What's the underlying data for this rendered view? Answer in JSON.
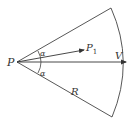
{
  "diagram": {
    "type": "sector-geometry",
    "stroke_color": "#333333",
    "background": "#ffffff",
    "labels": {
      "origin": "P",
      "p1": "P",
      "p1_subscript": "1",
      "velocity": "V",
      "radius": "R",
      "angle_top": "α",
      "angle_bottom": "α"
    }
  }
}
